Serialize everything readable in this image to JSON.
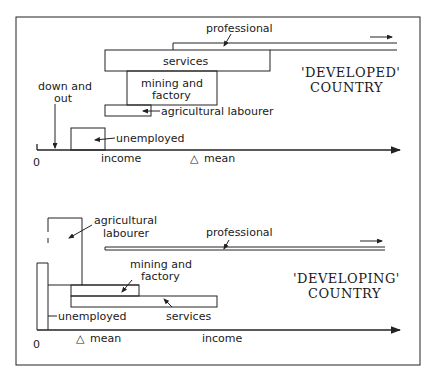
{
  "top_panel": {
    "title_line1": "'DEVELOPED'",
    "title_line2": "COUNTRY",
    "labels": {
      "professional": "professional",
      "services": "services",
      "mining": "mining and",
      "factory": "factory",
      "agricultural": "agricultural labourer",
      "down1": "down and",
      "down2": "out",
      "unemployed": "unemployed",
      "income": "income",
      "mean": "mean",
      "zero": "0"
    }
  },
  "bottom_panel": {
    "title_line1": "'DEVELOPING'",
    "title_line2": "COUNTRY",
    "labels": {
      "agricultural1": "agricultural",
      "agricultural2": "labourer",
      "professional": "professional",
      "mining": "mining and",
      "factory": "factory",
      "services": "services",
      "unemployed": "unemployed",
      "mean": "mean",
      "income": "income",
      "zero": "0"
    }
  },
  "mean_symbol": "△"
}
